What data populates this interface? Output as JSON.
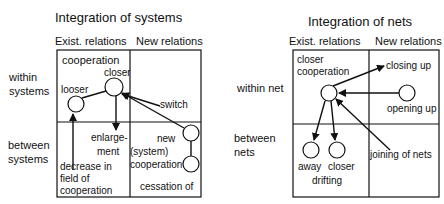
{
  "left_diagram": {
    "title": "Integration of systems",
    "col_headers": [
      "Exist. relations",
      "New relations"
    ],
    "row_labels": {
      "row1_line1": "within",
      "row1_line2": "systems",
      "row2_line1": "between",
      "row2_line2": "systems"
    },
    "cell_labels": {
      "cooperation": "cooperation",
      "closer": "closer",
      "looser": "looser",
      "switch": "switch",
      "enlargement_1": "enlarge-",
      "enlargement_2": "ment",
      "new": "new",
      "system": "(system)",
      "cooperation2": "cooperation",
      "cessation": "cessation of",
      "decrease_1": "decrease in",
      "decrease_2": "field of",
      "decrease_3": "cooperation"
    }
  },
  "right_diagram": {
    "title": "Integration of nets",
    "col_headers": [
      "Exist. relations",
      "New relations"
    ],
    "row_labels": {
      "row1": "within net",
      "row2_line1": "between",
      "row2_line2": "nets"
    },
    "cell_labels": {
      "closer_1": "closer",
      "closer_2": "cooperation",
      "closing_up": "closing up",
      "opening_up": "opening up",
      "away": "away",
      "closer": "closer",
      "drifting": "drifting",
      "joining": "joining of nets"
    }
  },
  "colors": {
    "line": "#111111",
    "background": "#ffffff"
  }
}
